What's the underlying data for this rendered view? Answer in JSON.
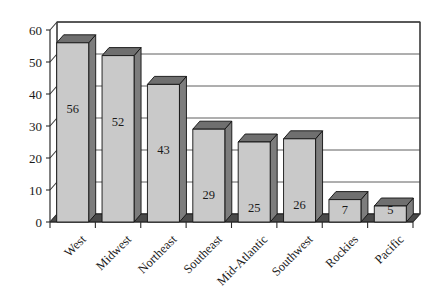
{
  "chart_data": {
    "type": "bar",
    "title": "",
    "subtitle": "",
    "xlabel": "",
    "ylabel": "",
    "categories": [
      "West",
      "Midwest",
      "Northeast",
      "Southeast",
      "Mid-Atlantic",
      "Southwest",
      "Rockies",
      "Pacific"
    ],
    "values": [
      56,
      52,
      43,
      29,
      25,
      26,
      7,
      5
    ],
    "value_labels": [
      "56",
      "52",
      "43",
      "29",
      "25",
      "26",
      "7",
      "5"
    ],
    "ylim": [
      0,
      60
    ],
    "y_ticks": [
      0,
      10,
      20,
      30,
      40,
      50,
      60
    ],
    "y_tick_labels": [
      "0",
      "10",
      "20",
      "30",
      "40",
      "50",
      "60"
    ],
    "grid": true,
    "grid_axis": "y",
    "legend": false,
    "legend_position": "none",
    "style": "3d-column",
    "colors": {
      "bar_front": "#c9c9c9",
      "bar_side": "#7d7d7d",
      "bar_top": "#6f6f6f",
      "floor": "#4a4a4a",
      "wall": "#ffffff",
      "gridline": "#4d4d4d",
      "outline": "#111111",
      "text": "#1a1a1a",
      "background": "#ffffff"
    }
  }
}
